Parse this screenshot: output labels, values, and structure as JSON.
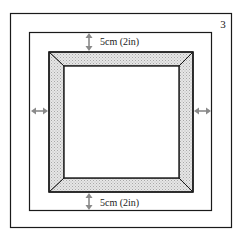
{
  "diagram": {
    "step_number": "3",
    "top_measurement": "5cm (2in)",
    "bottom_measurement": "5cm (2in)",
    "colors": {
      "line": "#1a1a1a",
      "frame_fill": "#d8d8d8",
      "arrow": "#8a8a8a",
      "background": "#ffffff"
    },
    "elements": [
      {
        "name": "outer-border",
        "description": "outer page border"
      },
      {
        "name": "mount-board",
        "description": "mount board outline with 5cm margin"
      },
      {
        "name": "picture-frame",
        "description": "mitred frame moulding with hatched fill"
      },
      {
        "name": "inner-window",
        "description": "frame opening"
      }
    ],
    "arrows": [
      {
        "name": "top-dimension-arrow",
        "orientation": "vertical"
      },
      {
        "name": "bottom-dimension-arrow",
        "orientation": "vertical"
      },
      {
        "name": "left-dimension-arrow",
        "orientation": "horizontal"
      },
      {
        "name": "right-dimension-arrow",
        "orientation": "horizontal"
      }
    ]
  }
}
